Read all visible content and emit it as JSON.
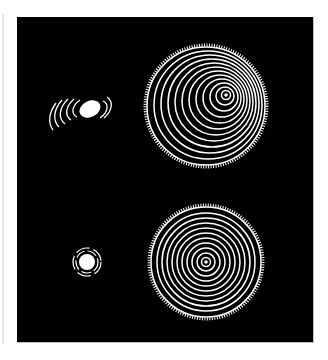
{
  "figure": {
    "background_color": "#000000",
    "foreground_color": "#ffffff",
    "panels": [
      {
        "id": "top-left",
        "shape": "ellipse with arc fringes",
        "center": [
          90,
          109
        ],
        "rx": 11,
        "ry": 8
      },
      {
        "id": "top-right",
        "shape": "disk with eccentric rings",
        "center": [
          206,
          106
        ],
        "radius": 60,
        "ring_count": 11
      },
      {
        "id": "bottom-left",
        "shape": "circle with broken ring fringes",
        "center": [
          87,
          262
        ],
        "radius": 8
      },
      {
        "id": "bottom-right",
        "shape": "disk with concentric rings",
        "center": [
          206,
          262
        ],
        "radius": 56,
        "ring_count": 10
      }
    ]
  }
}
